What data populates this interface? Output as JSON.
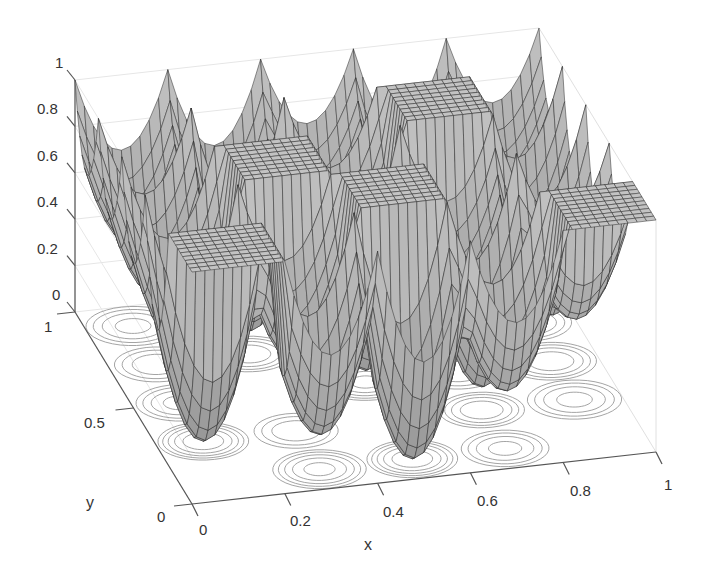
{
  "chart_data": {
    "type": "surface",
    "title": "",
    "xlabel": "x",
    "ylabel": "y",
    "zlabel": "",
    "xlim": [
      0,
      1
    ],
    "ylim": [
      0,
      1
    ],
    "zlim": [
      0,
      1
    ],
    "x_ticks": [
      "0",
      "0.2",
      "0.4",
      "0.6",
      "0.8",
      "1"
    ],
    "y_ticks": [
      "0",
      "0.5",
      "1"
    ],
    "z_ticks": [
      "0",
      "0.2",
      "0.4",
      "0.6",
      "0.8",
      "1"
    ],
    "grid": true,
    "legend": null,
    "cells": {
      "x_edges": [
        0,
        0.2,
        0.4,
        0.6,
        0.8,
        1.0
      ],
      "y_edges": [
        0,
        0.2,
        0.4,
        0.6,
        0.8,
        1.0
      ],
      "well_min_z_by_row_y": [
        [
          1.0,
          0.15,
          0.0,
          0.25,
          1.0
        ],
        [
          0.0,
          0.3,
          1.0,
          0.1,
          0.35
        ],
        [
          0.25,
          1.0,
          0.05,
          0.3,
          0.2
        ],
        [
          0.3,
          0.1,
          0.35,
          1.0,
          0.25
        ],
        [
          0.35,
          0.3,
          0.4,
          0.3,
          0.4
        ]
      ]
    },
    "colors": {
      "surface_fill": "#b4b4b4",
      "surface_mesh": "#2a2a2a",
      "contour": "#9a9a9a",
      "axis": "#555555",
      "grid": "#e6e6e6"
    }
  },
  "axes": {
    "x_label": "x",
    "y_label": "y",
    "x_tick_labels": [
      "0",
      "0.2",
      "0.4",
      "0.6",
      "0.8",
      "1"
    ],
    "y_tick_labels": [
      "0",
      "0.5",
      "1"
    ],
    "z_tick_labels": [
      "0",
      "0.2",
      "0.4",
      "0.6",
      "0.8",
      "1"
    ]
  }
}
